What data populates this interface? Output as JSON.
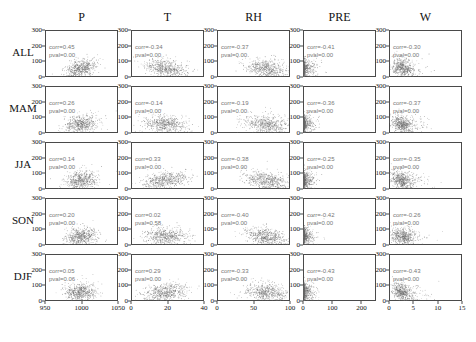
{
  "chart_data": {
    "type": "scatter",
    "title": "",
    "layout": {
      "rows": 5,
      "cols": 5,
      "grid": false,
      "legend": false
    },
    "row_labels": [
      "ALL",
      "MAM",
      "JJA",
      "SON",
      "DJF"
    ],
    "col_labels": [
      "P",
      "T",
      "RH",
      "PRE",
      "W"
    ],
    "ylabel": "",
    "ylim": [
      0,
      300
    ],
    "yticks": [
      "0",
      "100",
      "200",
      "300"
    ],
    "ytick_values": [
      0,
      100,
      200,
      300
    ],
    "columns": [
      {
        "name": "P",
        "xlim": [
          950,
          1050
        ],
        "xticks": [
          "950",
          "1000",
          "1050"
        ],
        "xtick_values": [
          950,
          1000,
          1050
        ],
        "center": 1000,
        "spread": 11
      },
      {
        "name": "T",
        "xlim": [
          0,
          40
        ],
        "xticks": [
          "0",
          "20",
          "40"
        ],
        "xtick_values": [
          0,
          20,
          40
        ],
        "center": 19,
        "spread": 6
      },
      {
        "name": "RH",
        "xlim": [
          0,
          100
        ],
        "xticks": [
          "0",
          "50",
          "100"
        ],
        "xtick_values": [
          0,
          50,
          100
        ],
        "center": 68,
        "spread": 15
      },
      {
        "name": "PRE",
        "xlim": [
          0,
          250
        ],
        "xticks": [
          "0",
          "100",
          "200"
        ],
        "xtick_values": [
          0,
          100,
          200
        ],
        "center": 5,
        "spread": 12
      },
      {
        "name": "W",
        "xlim": [
          0,
          15
        ],
        "xticks": [
          "0",
          "5",
          "10",
          "15"
        ],
        "xtick_values": [
          0,
          5,
          10,
          15
        ],
        "center": 2.6,
        "spread": 1.2
      }
    ],
    "point_color": "#6b6b6b",
    "panels": [
      {
        "row": "ALL",
        "col": "P",
        "corr": "corr=0.45",
        "pval": "pval=0.00",
        "corr_value": 0.45,
        "pval_value": 0.0
      },
      {
        "row": "ALL",
        "col": "T",
        "corr": "corr=-0.34",
        "pval": "pval=0.00",
        "corr_value": -0.34,
        "pval_value": 0.0
      },
      {
        "row": "ALL",
        "col": "RH",
        "corr": "corr=-0.37",
        "pval": "pval=0.00",
        "corr_value": -0.37,
        "pval_value": 0.0
      },
      {
        "row": "ALL",
        "col": "PRE",
        "corr": "corr=-0.41",
        "pval": "pval=0.00",
        "corr_value": -0.41,
        "pval_value": 0.0
      },
      {
        "row": "ALL",
        "col": "W",
        "corr": "corr=-0.30",
        "pval": "pval=0.00",
        "corr_value": -0.3,
        "pval_value": 0.0
      },
      {
        "row": "MAM",
        "col": "P",
        "corr": "corr=0.26",
        "pval": "pval=0.00",
        "corr_value": 0.26,
        "pval_value": 0.0
      },
      {
        "row": "MAM",
        "col": "T",
        "corr": "corr=-0.14",
        "pval": "pval=0.00",
        "corr_value": -0.14,
        "pval_value": 0.0
      },
      {
        "row": "MAM",
        "col": "RH",
        "corr": "corr=-0.19",
        "pval": "pval=0.00",
        "corr_value": -0.19,
        "pval_value": 0.0
      },
      {
        "row": "MAM",
        "col": "PRE",
        "corr": "corr=-0.36",
        "pval": "pval=0.00",
        "corr_value": -0.36,
        "pval_value": 0.0
      },
      {
        "row": "MAM",
        "col": "W",
        "corr": "corr=-0.37",
        "pval": "pval=0.00",
        "corr_value": -0.37,
        "pval_value": 0.0
      },
      {
        "row": "JJA",
        "col": "P",
        "corr": "corr=0.14",
        "pval": "pval=0.00",
        "corr_value": 0.14,
        "pval_value": 0.0
      },
      {
        "row": "JJA",
        "col": "T",
        "corr": "corr=0.33",
        "pval": "pval=0.00",
        "corr_value": 0.33,
        "pval_value": 0.0
      },
      {
        "row": "JJA",
        "col": "RH",
        "corr": "corr=-0.38",
        "pval": "pval=0.00",
        "corr_value": -0.38,
        "pval_value": 0.0
      },
      {
        "row": "JJA",
        "col": "PRE",
        "corr": "corr=-0.25",
        "pval": "pval=0.00",
        "corr_value": -0.25,
        "pval_value": 0.0
      },
      {
        "row": "JJA",
        "col": "W",
        "corr": "corr=-0.35",
        "pval": "pval=0.00",
        "corr_value": -0.35,
        "pval_value": 0.0
      },
      {
        "row": "SON",
        "col": "P",
        "corr": "corr=0.20",
        "pval": "pval=0.00",
        "corr_value": 0.2,
        "pval_value": 0.0
      },
      {
        "row": "SON",
        "col": "T",
        "corr": "corr=0.02",
        "pval": "pval=0.58",
        "corr_value": 0.02,
        "pval_value": 0.58
      },
      {
        "row": "SON",
        "col": "RH",
        "corr": "corr=-0.40",
        "pval": "pval=0.00",
        "corr_value": -0.4,
        "pval_value": 0.0
      },
      {
        "row": "SON",
        "col": "PRE",
        "corr": "corr=-0.42",
        "pval": "pval=0.00",
        "corr_value": -0.42,
        "pval_value": 0.0
      },
      {
        "row": "SON",
        "col": "W",
        "corr": "corr=-0.26",
        "pval": "pval=0.00",
        "corr_value": -0.26,
        "pval_value": 0.0
      },
      {
        "row": "DJF",
        "col": "P",
        "corr": "corr=0.05",
        "pval": "pval=0.06",
        "corr_value": 0.05,
        "pval_value": 0.06
      },
      {
        "row": "DJF",
        "col": "T",
        "corr": "corr=0.29",
        "pval": "pval=0.00",
        "corr_value": 0.29,
        "pval_value": 0.0
      },
      {
        "row": "DJF",
        "col": "RH",
        "corr": "corr=-0.33",
        "pval": "pval=0.00",
        "corr_value": -0.33,
        "pval_value": 0.0
      },
      {
        "row": "DJF",
        "col": "PRE",
        "corr": "corr=-0.43",
        "pval": "pval=0.00",
        "corr_value": -0.43,
        "pval_value": 0.0
      },
      {
        "row": "DJF",
        "col": "W",
        "corr": "corr=-0.43",
        "pval": "pval=0.00",
        "corr_value": -0.43,
        "pval_value": 0.0
      }
    ]
  }
}
